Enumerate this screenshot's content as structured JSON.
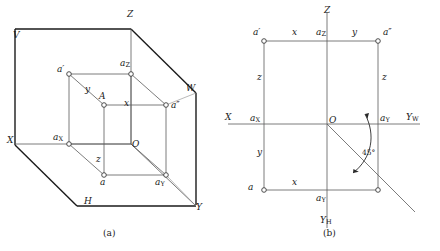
{
  "figure": {
    "title_a": "(a)",
    "title_b": "(b)",
    "stroke": "#4a4a4a",
    "heavy_stroke": "#1a1a1a",
    "text_color": "#1a1a1a"
  },
  "fig_a": {
    "caption": "(a)",
    "planes": {
      "v": "V",
      "h": "H",
      "w": "W"
    },
    "axes": {
      "x": "X",
      "y": "Y",
      "z": "Z"
    },
    "origin": "O",
    "points": {
      "a_front": "a′",
      "a_side": "a″",
      "a_top": "a",
      "space_point": "A",
      "ax": "a",
      "ax_sub": "X",
      "ay": "a",
      "ay_sub": "Y",
      "az": "a",
      "az_sub": "Z"
    },
    "dims": {
      "x": "x",
      "y": "y",
      "z": "z"
    }
  },
  "fig_b": {
    "caption": "(b)",
    "axes": {
      "x": "X",
      "z": "Z",
      "yw": "Y",
      "yw_sub": "W",
      "yh": "Y",
      "yh_sub": "H"
    },
    "origin": "O",
    "points": {
      "a_front": "a′",
      "a_side": "a″",
      "a_top": "a",
      "ax": "a",
      "ax_sub": "X",
      "ay_right": "a",
      "ay_right_sub": "Y",
      "ay_bottom": "a",
      "ay_bottom_sub": "Y",
      "az": "a",
      "az_sub": "Z"
    },
    "dims": {
      "x_top": "x",
      "y_top": "y",
      "z_left": "z",
      "z_right": "z",
      "y_left": "y",
      "x_bottom": "x"
    },
    "angle_label": "45°"
  }
}
